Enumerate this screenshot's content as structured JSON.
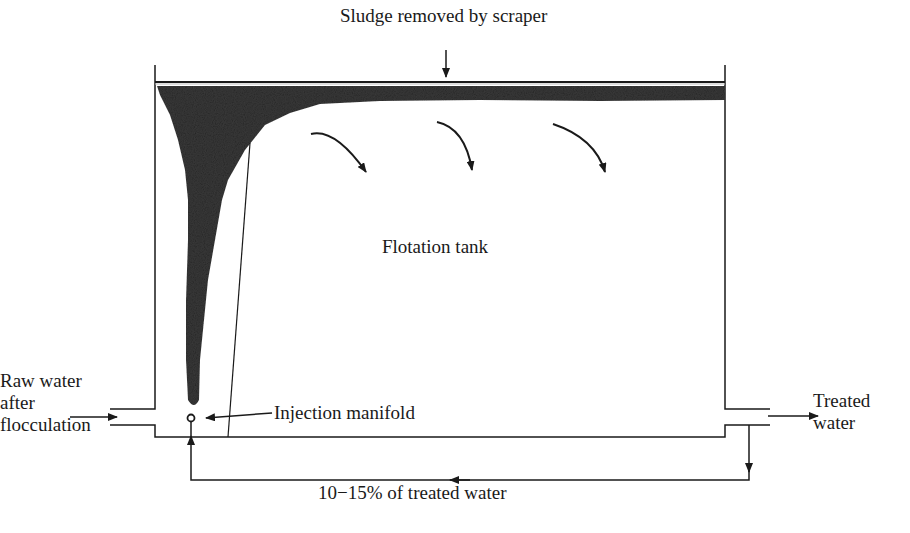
{
  "diagram": {
    "title_label": "Sludge removed by scraper",
    "tank_label": "Flotation tank",
    "inlet_label_line1": "Raw water",
    "inlet_label_line2": "after",
    "inlet_label_line3": "flocculation",
    "manifold_label": "Injection manifold",
    "outlet_label_line1": "Treated",
    "outlet_label_line2": "water",
    "recycle_label": "10−15% of treated water"
  },
  "colors": {
    "line": "#1a1a1a",
    "sludge": "#3a3a3a",
    "background": "#ffffff"
  }
}
